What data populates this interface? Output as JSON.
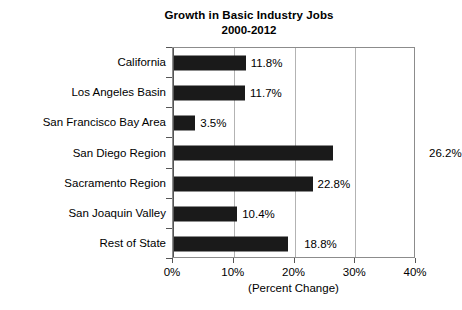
{
  "chart_data": {
    "type": "bar",
    "orientation": "horizontal",
    "title": "Growth in Basic Industry Jobs",
    "subtitle": "2000-2012",
    "xlabel": "(Percent Change)",
    "ylabel": "",
    "xlim": [
      0,
      40
    ],
    "xticks": [
      "0%",
      "10%",
      "20%",
      "30%",
      "40%"
    ],
    "xtick_values": [
      0,
      10,
      20,
      30,
      40
    ],
    "grid": "vertical gridlines at 10%, 20%, 30%",
    "legend": "none",
    "bar_color": "#1a1a1a",
    "categories": [
      "California",
      "Los Angeles Basin",
      "San Francisco Bay Area",
      "San Diego Region",
      "Sacramento Region",
      "San Joaquin Valley",
      "Rest of State"
    ],
    "values": [
      11.8,
      11.7,
      3.5,
      26.2,
      22.8,
      10.4,
      18.8
    ],
    "value_labels": [
      "11.8%",
      "11.7%",
      "3.5%",
      "26.2%",
      "22.8%",
      "10.4%",
      "18.8%"
    ],
    "label_placement": [
      "inside-right",
      "inside-right",
      "inside-right",
      "outside-plot",
      "inside-right",
      "inside-right",
      "inside-right-gap"
    ]
  }
}
